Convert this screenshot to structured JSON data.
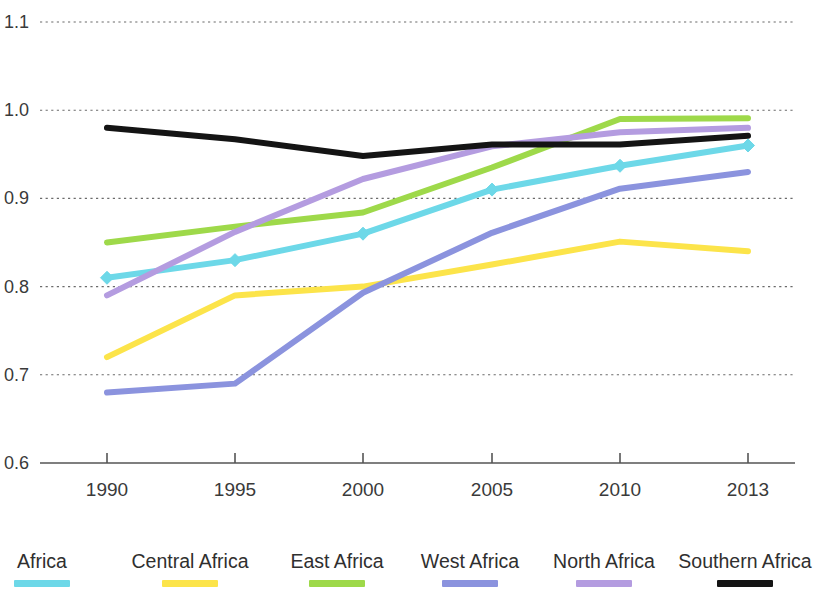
{
  "chart_data": {
    "type": "line",
    "title": "",
    "subtitle": "",
    "xlabel": "",
    "ylabel": "",
    "x": [
      1990,
      1995,
      2000,
      2005,
      2010,
      2013
    ],
    "x_tick_labels": [
      "1990",
      "1995",
      "2000",
      "2005",
      "2010",
      "2013"
    ],
    "y_tick_labels": [
      "1.1",
      "1.0",
      "0.9",
      "0.8",
      "0.7",
      "0.6"
    ],
    "y_ticks": [
      1.1,
      1.0,
      0.9,
      0.8,
      0.7,
      0.6
    ],
    "ylim": [
      0.6,
      1.1
    ],
    "xlim": [
      1990,
      2013
    ],
    "grid": true,
    "legend_position": "bottom",
    "series": [
      {
        "name": "Africa",
        "color": "#6dd8e8",
        "markers": true,
        "marker_shape": "diamond",
        "values": [
          0.81,
          0.83,
          0.86,
          0.91,
          0.937,
          0.96
        ]
      },
      {
        "name": "Central Africa",
        "color": "#fce44a",
        "markers": false,
        "marker_shape": "none",
        "values": [
          0.72,
          0.79,
          0.8,
          0.825,
          0.851,
          0.84
        ]
      },
      {
        "name": "East Africa",
        "color": "#9ed94a",
        "markers": false,
        "marker_shape": "none",
        "values": [
          0.85,
          0.868,
          0.884,
          0.935,
          0.99,
          0.991
        ]
      },
      {
        "name": "West Africa",
        "color": "#8b93de",
        "markers": false,
        "marker_shape": "none",
        "values": [
          0.68,
          0.69,
          0.793,
          0.861,
          0.911,
          0.93
        ]
      },
      {
        "name": "North Africa",
        "color": "#b49ce0",
        "markers": false,
        "marker_shape": "none",
        "values": [
          0.79,
          0.862,
          0.922,
          0.959,
          0.975,
          0.98
        ]
      },
      {
        "name": "Southern Africa",
        "color": "#141414",
        "markers": false,
        "marker_shape": "none",
        "values": [
          0.98,
          0.967,
          0.948,
          0.961,
          0.961,
          0.971
        ]
      }
    ]
  },
  "legend": {
    "items": [
      {
        "label": "Africa",
        "color": "#6dd8e8",
        "x": 42
      },
      {
        "label": "Central Africa",
        "color": "#fce44a",
        "x": 190
      },
      {
        "label": "East Africa",
        "color": "#9ed94a",
        "x": 337
      },
      {
        "label": "West Africa",
        "color": "#8b93de",
        "x": 470
      },
      {
        "label": "North Africa",
        "color": "#b49ce0",
        "x": 604
      },
      {
        "label": "Southern Africa",
        "color": "#141414",
        "x": 745
      }
    ]
  }
}
